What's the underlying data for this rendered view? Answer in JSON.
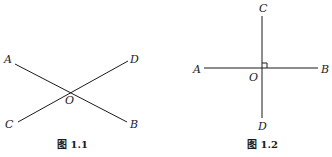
{
  "figures": [
    {
      "caption": "图 1.1",
      "labels": {
        "A": "A",
        "B": "B",
        "C": "C",
        "D": "D",
        "O": "O"
      },
      "description": "Two lines AB and CD intersecting at point O"
    },
    {
      "caption": "图 1.2",
      "labels": {
        "A": "A",
        "B": "B",
        "C": "C",
        "D": "D",
        "O": "O"
      },
      "description": "Two perpendicular lines AB and CD intersecting at O with right-angle marker"
    }
  ],
  "colors": {
    "line": "#1a1a1a",
    "background": "#ffffff"
  }
}
